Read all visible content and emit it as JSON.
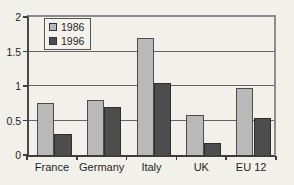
{
  "chart_data": {
    "type": "bar",
    "title": "",
    "categories": [
      "France",
      "Germany",
      "Italy",
      "UK",
      "EU 12"
    ],
    "series": [
      {
        "name": "1986",
        "color": "#b9b9b9",
        "border_color": "#4c4c4c",
        "values": [
          0.75,
          0.8,
          1.7,
          0.58,
          0.97
        ]
      },
      {
        "name": "1996",
        "color": "#4d4d4d",
        "border_color": "#2e2e2e",
        "values": [
          0.3,
          0.69,
          1.05,
          0.18,
          0.53
        ]
      }
    ],
    "xlabel": "",
    "ylabel": "",
    "ylim": [
      0,
      2
    ],
    "yticks": [
      0,
      0.5,
      1,
      1.5,
      2
    ],
    "ytick_labels": [
      "0",
      "0.5",
      "1",
      "1.5",
      "2"
    ],
    "grid": true,
    "legend_position": "top-left"
  },
  "colors": {
    "background": "#f2f0ea",
    "gridline": "#646464",
    "frame": "#8c8c8c",
    "axis": "#3d3d3d",
    "text": "#1f1f1f"
  }
}
